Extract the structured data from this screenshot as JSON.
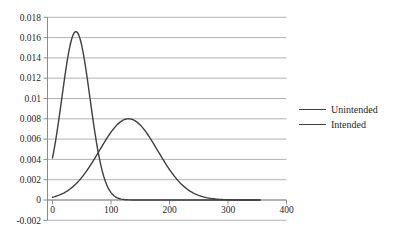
{
  "chart_data": {
    "type": "line",
    "title": "",
    "xlabel": "",
    "ylabel": "",
    "xlim": [
      0,
      400
    ],
    "ylim": [
      -0.002,
      0.018
    ],
    "grid": "horizontal",
    "legend_position": "right",
    "x_ticks": [
      0,
      100,
      200,
      300,
      400
    ],
    "x_tick_labels": [
      "0",
      "100",
      "200",
      "300",
      "400"
    ],
    "y_ticks": [
      -0.002,
      0,
      0.002,
      0.004,
      0.006,
      0.008,
      0.01,
      0.012,
      0.014,
      0.016,
      0.018
    ],
    "y_tick_labels": [
      "-0.002",
      "0",
      "0.002",
      "0.004",
      "0.006",
      "0.008",
      "0.01",
      "0.012",
      "0.014",
      "0.016",
      "0.018"
    ],
    "series": [
      {
        "name": "Unintended",
        "shape": "gaussian",
        "mean": 40,
        "sd": 24,
        "peak": 0.0166,
        "x_range": [
          0,
          355
        ],
        "sampled_x": [
          0,
          20,
          40,
          60,
          80,
          100,
          120,
          140,
          160,
          180,
          200,
          220,
          240,
          260,
          280,
          300,
          320,
          340,
          360
        ],
        "sampled_y": [
          0.00415,
          0.01174,
          0.0166,
          0.01174,
          0.00415,
          0.00073,
          6e-05,
          0,
          0,
          0,
          0,
          0,
          0,
          0,
          0,
          0,
          0,
          0,
          0
        ]
      },
      {
        "name": "Intended",
        "shape": "gaussian",
        "mean": 130,
        "sd": 50,
        "peak": 0.008,
        "x_range": [
          0,
          355
        ],
        "sampled_x": [
          0,
          20,
          40,
          60,
          80,
          100,
          120,
          140,
          160,
          180,
          200,
          220,
          240,
          260,
          280,
          300,
          320,
          340,
          360
        ],
        "sampled_y": [
          0.00027,
          0.00071,
          0.00158,
          0.00299,
          0.00484,
          0.00666,
          0.00782,
          0.00782,
          0.00666,
          0.00484,
          0.00299,
          0.00158,
          0.00071,
          0.00027,
          9e-05,
          2e-05,
          1e-05,
          0,
          0
        ]
      }
    ],
    "colors": {
      "line": "#3f3f3f",
      "grid": "#b3b3b3",
      "axis": "#8c8c8c",
      "text": "#1f1f1f",
      "background": "#ffffff"
    }
  }
}
